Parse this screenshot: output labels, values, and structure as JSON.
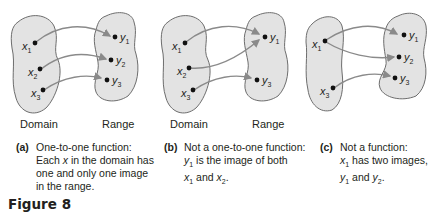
{
  "figure": {
    "title": "Figure 8"
  },
  "colors": {
    "blob_fill": "#e3e3e3",
    "blob_stroke": "#6d6d6d",
    "arrow": "#8a8a8a",
    "dot": "#111111",
    "text": "#231f20"
  },
  "panels": [
    {
      "id": "a",
      "domain_label": "Domain",
      "range_label": "Range",
      "domain_points": [
        "x1",
        "x2",
        "x3"
      ],
      "range_points": [
        "y1",
        "y2",
        "y3"
      ],
      "mappings": [
        [
          "x1",
          "y1"
        ],
        [
          "x2",
          "y2"
        ],
        [
          "x3",
          "y3"
        ]
      ],
      "caption_tag": "(a)",
      "caption_lines": [
        "One-to-one function:",
        "Each x in the domain has",
        "one and only one image",
        "in the range."
      ]
    },
    {
      "id": "b",
      "domain_label": "Domain",
      "range_label": "Range",
      "domain_points": [
        "x1",
        "x2",
        "x3"
      ],
      "range_points": [
        "y1",
        "y3"
      ],
      "mappings": [
        [
          "x1",
          "y1"
        ],
        [
          "x2",
          "y1"
        ],
        [
          "x3",
          "y3"
        ]
      ],
      "caption_tag": "(b)",
      "caption_lines": [
        "Not a one-to-one function:",
        "y1 is the image of both",
        "x1 and x2."
      ]
    },
    {
      "id": "c",
      "domain_points": [
        "x1",
        "x3"
      ],
      "range_points": [
        "y1",
        "y2",
        "y3"
      ],
      "mappings": [
        [
          "x1",
          "y1"
        ],
        [
          "x1",
          "y2"
        ],
        [
          "x3",
          "y3"
        ]
      ],
      "caption_tag": "(c)",
      "caption_lines": [
        "Not a function:",
        "x1 has two images,",
        "y1 and y2."
      ]
    }
  ]
}
